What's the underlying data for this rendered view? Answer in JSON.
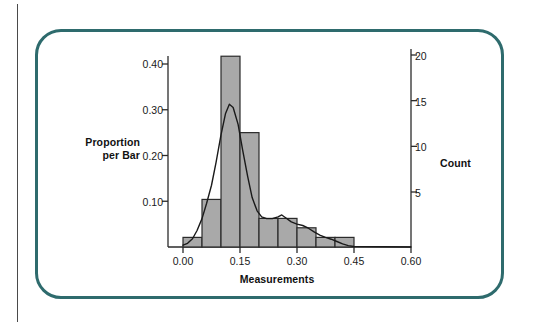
{
  "figure": {
    "frame_color": "#2e6b6d",
    "background": "#ffffff",
    "page_rule_color": "#4a4a4a"
  },
  "chart_data": {
    "type": "bar",
    "title": "",
    "subtitle": "",
    "xlabel": "Measurements",
    "ylabel": "Proportion\nper Bar",
    "ylabel_line1": "Proportion",
    "ylabel_line2": "per Bar",
    "y2label": "Count",
    "grid": false,
    "legend": "none",
    "xlim": [
      0.0,
      0.6
    ],
    "ylim": [
      0.0,
      0.4375
    ],
    "y2lim": [
      0,
      21
    ],
    "xticks": [
      0.0,
      0.15,
      0.3,
      0.45,
      0.6
    ],
    "xticklabels": [
      "0.00",
      "0.15",
      "0.30",
      "0.45",
      "0.60"
    ],
    "yticks": [
      0.1,
      0.2,
      0.3,
      0.4
    ],
    "yticklabels": [
      "0.10",
      "0.20",
      "0.30",
      "0.40"
    ],
    "y2ticks": [
      5,
      10,
      15,
      20
    ],
    "y2ticklabels": [
      "5",
      "10",
      "15",
      "20"
    ],
    "bar_width": 0.05,
    "bar_fill": "#a9a9a9",
    "bar_edge": "#2b2b2b",
    "curve_color": "#1a1a1a",
    "categories": [
      "0.00",
      "0.05",
      "0.10",
      "0.15",
      "0.20",
      "0.25",
      "0.30",
      "0.35",
      "0.40"
    ],
    "bin_starts": [
      0.0,
      0.05,
      0.1,
      0.15,
      0.2,
      0.25,
      0.3,
      0.35,
      0.4
    ],
    "bin_ends": [
      0.05,
      0.1,
      0.15,
      0.2,
      0.25,
      0.3,
      0.35,
      0.4,
      0.45
    ],
    "values": [
      0.021,
      0.104,
      0.417,
      0.25,
      0.0625,
      0.0625,
      0.042,
      0.021,
      0.021
    ],
    "counts": [
      1,
      5,
      20,
      12,
      3,
      3,
      2,
      1,
      1
    ],
    "density_curve": [
      [
        0.0,
        0.004
      ],
      [
        0.012,
        0.008
      ],
      [
        0.025,
        0.018
      ],
      [
        0.037,
        0.036
      ],
      [
        0.05,
        0.062
      ],
      [
        0.062,
        0.095
      ],
      [
        0.075,
        0.135
      ],
      [
        0.087,
        0.185
      ],
      [
        0.1,
        0.245
      ],
      [
        0.112,
        0.292
      ],
      [
        0.122,
        0.312
      ],
      [
        0.132,
        0.305
      ],
      [
        0.145,
        0.268
      ],
      [
        0.157,
        0.212
      ],
      [
        0.17,
        0.155
      ],
      [
        0.182,
        0.108
      ],
      [
        0.195,
        0.079
      ],
      [
        0.207,
        0.066
      ],
      [
        0.22,
        0.062
      ],
      [
        0.235,
        0.062
      ],
      [
        0.25,
        0.066
      ],
      [
        0.26,
        0.07
      ],
      [
        0.27,
        0.064
      ],
      [
        0.285,
        0.055
      ],
      [
        0.3,
        0.05
      ],
      [
        0.315,
        0.047
      ],
      [
        0.33,
        0.041
      ],
      [
        0.345,
        0.033
      ],
      [
        0.36,
        0.026
      ],
      [
        0.375,
        0.021
      ],
      [
        0.39,
        0.017
      ],
      [
        0.405,
        0.012
      ],
      [
        0.42,
        0.007
      ],
      [
        0.435,
        0.003
      ],
      [
        0.45,
        0.001
      ],
      [
        0.6,
        0.0
      ]
    ]
  }
}
